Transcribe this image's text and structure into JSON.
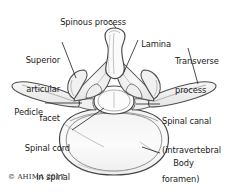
{
  "figure": {
    "copyright": "© AHIMA 2017",
    "background_color": "#ffffff",
    "ink_color": "#3a3a3a",
    "shade_color": "#e8e8e8",
    "text_color": "#1a1a1a"
  },
  "labels": {
    "spinous_process": "Spinous process",
    "lamina": "Lamina",
    "transverse_process_line1": "Transverse",
    "transverse_process_line2": "process",
    "superior_articular_facet_line1": "Superior",
    "superior_articular_facet_line2": "articular",
    "superior_articular_facet_line3": "facet",
    "pedicle": "Pedicle",
    "spinal_canal_line1": "Spinal canal",
    "spinal_canal_line2": "(intravertebral",
    "spinal_canal_line3": "foramen)",
    "spinal_cord_line1": "Spinal cord",
    "spinal_cord_line2": "in spinal",
    "spinal_cord_line3": "canal",
    "body": "Body"
  }
}
